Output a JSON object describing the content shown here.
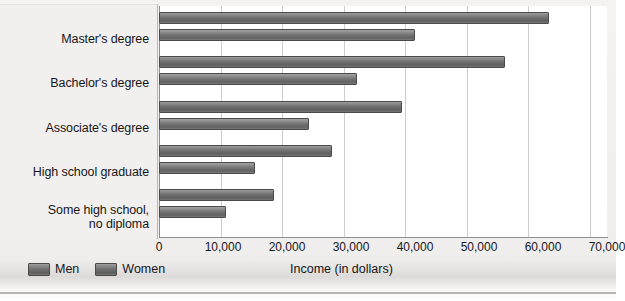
{
  "chart_data": {
    "type": "bar",
    "orientation": "horizontal",
    "title": "",
    "xlabel": "Income (in dollars)",
    "ylabel": "",
    "xlim": [
      0,
      70000
    ],
    "xticks": [
      "0",
      "10,000",
      "20,000",
      "30,000",
      "40,000",
      "50,000",
      "60,000",
      "70,000"
    ],
    "xtick_values": [
      0,
      10000,
      20000,
      30000,
      40000,
      50000,
      60000,
      70000
    ],
    "grid": "vertical",
    "legend_position": "bottom-left",
    "categories": [
      "Master's degree",
      "Bachelor's degree",
      "Associate's degree",
      "High school graduate",
      "Some high school, no diploma"
    ],
    "category_labels": [
      [
        "Master's degree"
      ],
      [
        "Bachelor's degree"
      ],
      [
        "Associate's degree"
      ],
      [
        "High school graduate"
      ],
      [
        "Some high school,",
        "no diploma"
      ]
    ],
    "series": [
      {
        "name": "Men",
        "values": [
          61000,
          54000,
          38000,
          27000,
          18000
        ]
      },
      {
        "name": "Women",
        "values": [
          40000,
          31000,
          23500,
          15000,
          10500
        ]
      }
    ]
  },
  "legend": {
    "items": [
      {
        "label": "Men"
      },
      {
        "label": "Women"
      }
    ]
  },
  "colors": {
    "bar_men": "#6f6f6f",
    "bar_women": "#727272",
    "bar_border": "#4a4a4a",
    "grid": "#cdcdcd",
    "axis": "#8d8d8d",
    "panel": "#f1f0ee",
    "plot_background": "#ffffff",
    "text": "#16161a"
  }
}
